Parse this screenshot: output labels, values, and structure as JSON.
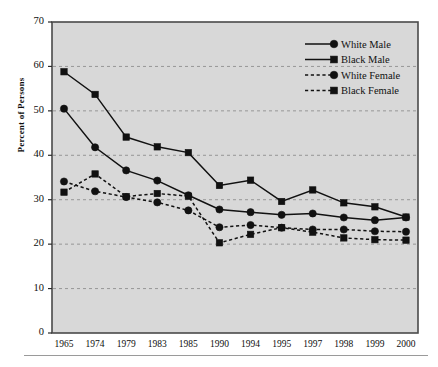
{
  "chart_data": {
    "type": "line",
    "title": "",
    "xlabel": "",
    "ylabel": "Percent of Persons",
    "categories": [
      "1965",
      "1974",
      "1979",
      "1983",
      "1985",
      "1990",
      "1994",
      "1995",
      "1997",
      "1998",
      "1999",
      "2000"
    ],
    "ylim": [
      0,
      70
    ],
    "ytick_step": 10,
    "yticks": [
      "0",
      "10",
      "20",
      "30",
      "40",
      "50",
      "60",
      "70"
    ],
    "grid": "horizontal-dashed",
    "legend_position": "top-right",
    "plot_background": "#d8d8d8",
    "series": [
      {
        "name": "White Male",
        "line": "solid",
        "marker": "circle",
        "color": "#111111",
        "values": [
          50.5,
          41.8,
          36.6,
          34.3,
          31.0,
          27.8,
          27.2,
          26.6,
          26.9,
          26.0,
          25.4,
          26.0
        ]
      },
      {
        "name": "Black Male",
        "line": "solid",
        "marker": "square",
        "color": "#111111",
        "values": [
          58.8,
          53.7,
          44.1,
          41.9,
          40.6,
          33.2,
          34.4,
          29.6,
          32.2,
          29.3,
          28.4,
          26.1
        ]
      },
      {
        "name": "White Female",
        "line": "dotted",
        "marker": "circle",
        "color": "#111111",
        "values": [
          34.1,
          31.9,
          30.6,
          29.4,
          27.6,
          23.8,
          24.3,
          23.7,
          23.3,
          23.3,
          22.9,
          22.8
        ]
      },
      {
        "name": "Black Female",
        "line": "dotted",
        "marker": "square",
        "color": "#111111",
        "values": [
          31.7,
          35.8,
          30.7,
          31.4,
          30.8,
          20.3,
          22.2,
          23.7,
          22.7,
          21.4,
          21.0,
          20.9
        ]
      }
    ]
  },
  "axes": {
    "y_axis_label": "Percent of Persons"
  }
}
